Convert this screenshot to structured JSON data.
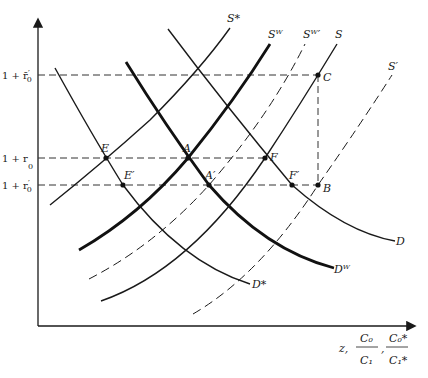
{
  "diagram": {
    "type": "supply-demand",
    "axes": {
      "x_label_prefix": "z,",
      "x_label_frac1_num": "C₀",
      "x_label_frac1_den": "C₁",
      "x_label_sep": ",",
      "x_label_frac2_num": "C₀*",
      "x_label_frac2_den": "C₁*",
      "y_ticks": [
        {
          "label_main": "1 + r̄",
          "label_sub": "0",
          "label_sup": "′",
          "y": 75
        },
        {
          "label_main": "1 + r",
          "label_sub": "0",
          "label_sup": "",
          "y": 158
        },
        {
          "label_main": "1 + r",
          "label_sub": "0",
          "label_sup": "′",
          "y": 185
        }
      ]
    },
    "curves": [
      {
        "id": "D*",
        "label": "D*",
        "style": "thin",
        "path": "M55,68 Q92,135 123,185 Q180,262 250,284",
        "label_x": 252,
        "label_y": 288
      },
      {
        "id": "Dw",
        "label": "Dᵂ",
        "style": "thick",
        "path": "M126,62 Q165,125 209,185 Q265,250 334,268",
        "label_x": 334,
        "label_y": 273
      },
      {
        "id": "D",
        "label": "D",
        "style": "thin",
        "path": "M168,29 Q225,105 292,185 Q345,232 395,241",
        "label_x": 396,
        "label_y": 245
      },
      {
        "id": "S*",
        "label": "S*",
        "style": "thin",
        "path": "M50,205 Q100,165 150,120 Q200,70 230,28",
        "label_x": 227,
        "label_y": 22
      },
      {
        "id": "Sw",
        "label": "Sᵂ",
        "style": "thick",
        "path": "M79,250 Q140,215 188,158 Q235,100 270,44",
        "label_x": 268,
        "label_y": 38
      },
      {
        "id": "Sw'",
        "label": "Sᵂ′",
        "style": "dashed",
        "path": "M89,279 Q155,245 209,185 Q270,115 305,44",
        "label_x": 303,
        "label_y": 38
      },
      {
        "id": "S",
        "label": "S",
        "style": "thin",
        "path": "M101,301 Q190,270 265,158 Q300,105 337,44",
        "label_x": 335,
        "label_y": 38
      },
      {
        "id": "S'",
        "label": "S′",
        "style": "dashed",
        "path": "M193,314 Q260,275 318,185 Q360,125 392,75",
        "label_x": 388,
        "label_y": 70
      }
    ],
    "points": [
      {
        "label": "E",
        "x": 106,
        "y": 158,
        "lx": 101,
        "ly": 152
      },
      {
        "label": "A",
        "x": 188,
        "y": 158,
        "lx": 183,
        "ly": 152
      },
      {
        "label": "F",
        "x": 265,
        "y": 158,
        "lx": 270,
        "ly": 161
      },
      {
        "label": "E′",
        "x": 123,
        "y": 185,
        "lx": 124,
        "ly": 179
      },
      {
        "label": "A′",
        "x": 209,
        "y": 185,
        "lx": 205,
        "ly": 179
      },
      {
        "label": "F′",
        "x": 292,
        "y": 185,
        "lx": 289,
        "ly": 179
      },
      {
        "label": "B",
        "x": 318,
        "y": 185,
        "lx": 323,
        "ly": 192
      },
      {
        "label": "C",
        "x": 318,
        "y": 75,
        "lx": 323,
        "ly": 81
      }
    ],
    "guides": [
      {
        "x1": 38,
        "y1": 75,
        "x2": 318,
        "y2": 75
      },
      {
        "x1": 38,
        "y1": 158,
        "x2": 265,
        "y2": 158
      },
      {
        "x1": 38,
        "y1": 185,
        "x2": 318,
        "y2": 185
      },
      {
        "x1": 318,
        "y1": 75,
        "x2": 318,
        "y2": 185
      }
    ]
  }
}
